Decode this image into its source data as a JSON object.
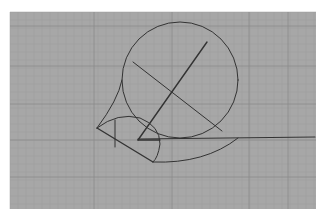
{
  "figure": {
    "background": "#ffffff",
    "plot_area": {
      "x": 10,
      "y": 12,
      "width": 306,
      "height": 197,
      "fill": "#a7a7a7"
    },
    "grid": {
      "minor_step": 8,
      "minor_color": "#9c9c9c",
      "major_color": "#8a8a8a",
      "major_x": [
        94,
        172,
        249,
        288
      ],
      "major_y": [
        26,
        66,
        104,
        140,
        177
      ]
    },
    "stroke_color": "#333333"
  },
  "shapes": {
    "large_circle": {
      "cx": 180,
      "cy": 80,
      "r": 58
    },
    "chord_upper_left_to_lower_right": {
      "x1": 133,
      "y1": 62,
      "x2": 222,
      "y2": 131
    },
    "radius_line_up_right": {
      "x1": 138,
      "y1": 140,
      "x2": 207,
      "y2": 42
    },
    "horizontal_axis": {
      "x1": 138,
      "y1": 139,
      "x2": 315,
      "y2": 137
    },
    "sector_arc": {
      "path": "M 97 128 Q 118 112 140 118 Q 160 126 160 144 Q 158 158 153 162"
    },
    "sector_left_edge": {
      "x1": 97,
      "y1": 128,
      "x2": 153,
      "y2": 162
    },
    "sector_inner_vertical": {
      "x1": 115,
      "y1": 120,
      "x2": 115,
      "y2": 147
    },
    "sector_horizontal": {
      "x1": 138,
      "y1": 140,
      "x2": 160,
      "y2": 140
    },
    "lower_arc": {
      "path": "M 153 162 Q 205 164 238 138"
    },
    "left_circle_arc_extension": {
      "path": "M 122 80 Q 118 100 97 128"
    }
  }
}
